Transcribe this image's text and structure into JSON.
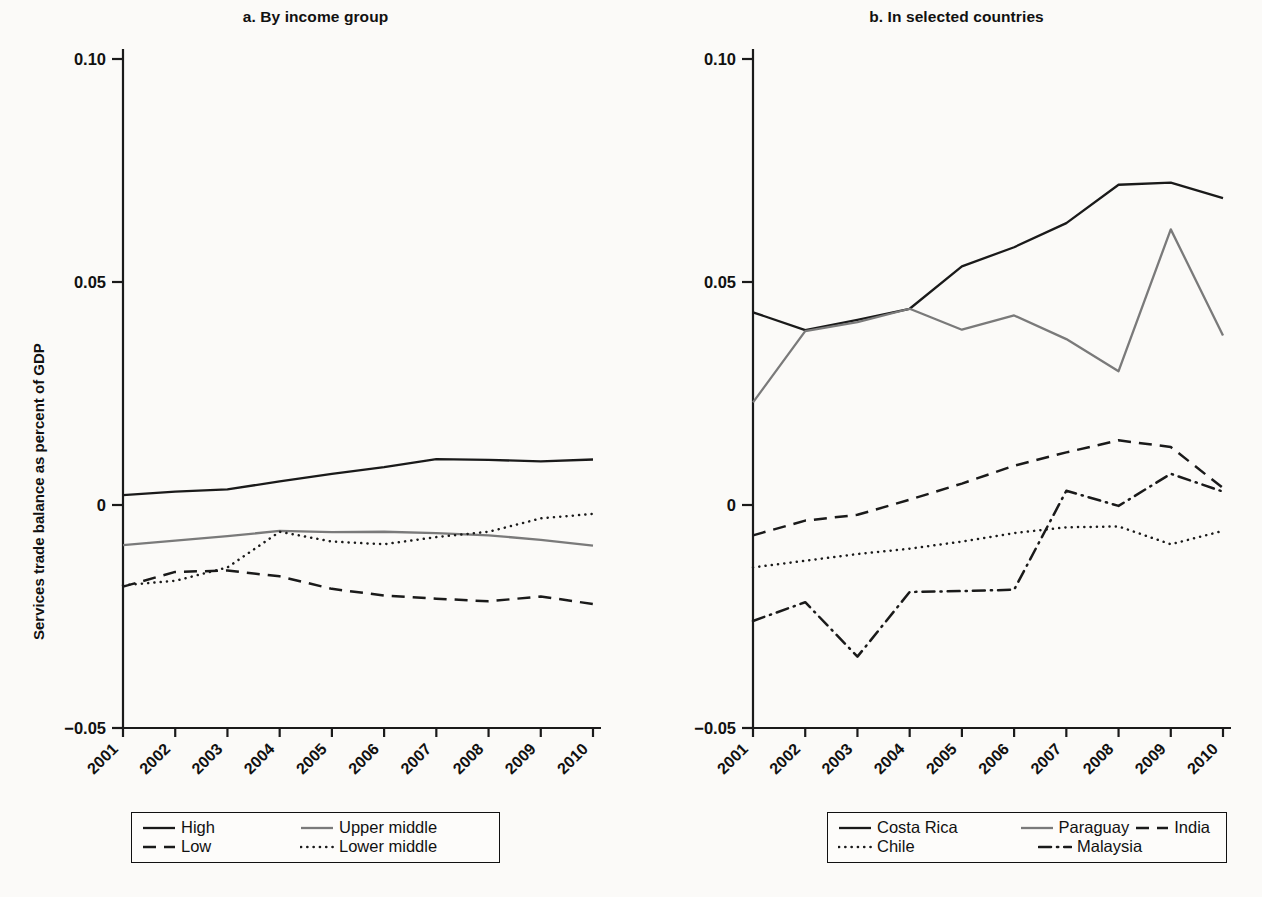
{
  "figure": {
    "ylabel": "Services trade balance as percent of GDP",
    "ytick_labels": [
      "0.10",
      "0.05",
      "0",
      "−0.05"
    ],
    "ytick_values": [
      0.1,
      0.05,
      0,
      -0.05
    ],
    "xtick_labels": [
      "2001",
      "2002",
      "2003",
      "2004",
      "2005",
      "2006",
      "2007",
      "2008",
      "2009",
      "2010"
    ]
  },
  "panel_a": {
    "title": "a. By income group",
    "legend": [
      {
        "label": "High",
        "style": "solid",
        "color": "#1a1a1a",
        "icon": "line-solid-black-icon"
      },
      {
        "label": "Upper middle",
        "style": "solid",
        "color": "#7a7a7a",
        "icon": "line-solid-gray-icon"
      },
      {
        "label": "Low",
        "style": "dashed",
        "color": "#1a1a1a",
        "icon": "line-dashed-icon"
      },
      {
        "label": "Lower middle",
        "style": "dotted",
        "color": "#1a1a1a",
        "icon": "line-dotted-icon"
      }
    ]
  },
  "panel_b": {
    "title": "b. In selected countries",
    "legend": [
      {
        "label": "Costa Rica",
        "style": "solid",
        "color": "#1a1a1a",
        "icon": "line-solid-black-icon"
      },
      {
        "label": "Paraguay",
        "style": "solid",
        "color": "#7a7a7a",
        "icon": "line-solid-gray-icon"
      },
      {
        "label": "India",
        "style": "dashed",
        "color": "#1a1a1a",
        "icon": "line-dashed-icon"
      },
      {
        "label": "Chile",
        "style": "dotted",
        "color": "#1a1a1a",
        "icon": "line-dotted-icon"
      },
      {
        "label": "Malaysia",
        "style": "dashdot",
        "color": "#1a1a1a",
        "icon": "line-dashdot-icon"
      }
    ]
  },
  "chart_data": [
    {
      "id": "panel_a",
      "type": "line",
      "title": "a. By income group",
      "xlabel": "",
      "ylabel": "Services trade balance as percent of GDP",
      "x": [
        2001,
        2002,
        2003,
        2004,
        2005,
        2006,
        2007,
        2008,
        2009,
        2010
      ],
      "ylim": [
        -0.05,
        0.1
      ],
      "yticks": [
        -0.05,
        0,
        0.05,
        0.1
      ],
      "grid": false,
      "legend_position": "bottom",
      "series": [
        {
          "name": "High",
          "style": "solid",
          "color": "#1a1a1a",
          "values": [
            0.0022,
            0.003,
            0.0035,
            0.0053,
            0.007,
            0.0085,
            0.0103,
            0.0101,
            0.0098,
            0.0102
          ]
        },
        {
          "name": "Upper middle",
          "style": "solid",
          "color": "#7a7a7a",
          "values": [
            -0.009,
            -0.008,
            -0.007,
            -0.0058,
            -0.0061,
            -0.006,
            -0.0063,
            -0.0068,
            -0.0078,
            -0.0091
          ]
        },
        {
          "name": "Low",
          "style": "dashed",
          "color": "#1a1a1a",
          "values": [
            -0.0183,
            -0.015,
            -0.0147,
            -0.016,
            -0.0188,
            -0.0203,
            -0.021,
            -0.0216,
            -0.0205,
            -0.0222
          ]
        },
        {
          "name": "Lower middle",
          "style": "dotted",
          "color": "#1a1a1a",
          "values": [
            -0.018,
            -0.017,
            -0.014,
            -0.006,
            -0.0082,
            -0.0088,
            -0.0072,
            -0.006,
            -0.003,
            -0.002
          ]
        }
      ]
    },
    {
      "id": "panel_b",
      "type": "line",
      "title": "b. In selected countries",
      "xlabel": "",
      "ylabel": "Services trade balance as percent of GDP",
      "x": [
        2001,
        2002,
        2003,
        2004,
        2005,
        2006,
        2007,
        2008,
        2009,
        2010
      ],
      "ylim": [
        -0.05,
        0.1
      ],
      "yticks": [
        -0.05,
        0,
        0.05,
        0.1
      ],
      "grid": false,
      "legend_position": "bottom",
      "series": [
        {
          "name": "Costa Rica",
          "style": "solid",
          "color": "#1a1a1a",
          "values": [
            0.0432,
            0.0392,
            0.0415,
            0.044,
            0.0535,
            0.0578,
            0.0632,
            0.0718,
            0.0723,
            0.0688
          ]
        },
        {
          "name": "Paraguay",
          "style": "solid",
          "color": "#7a7a7a",
          "values": [
            0.023,
            0.039,
            0.041,
            0.044,
            0.0393,
            0.0425,
            0.0372,
            0.03,
            0.0618,
            0.038
          ]
        },
        {
          "name": "India",
          "style": "dashed",
          "color": "#1a1a1a",
          "values": [
            -0.0068,
            -0.0035,
            -0.0022,
            0.0012,
            0.0048,
            0.0088,
            0.0118,
            0.0145,
            0.013,
            0.0038
          ]
        },
        {
          "name": "Chile",
          "style": "dotted",
          "color": "#1a1a1a",
          "values": [
            -0.014,
            -0.0125,
            -0.011,
            -0.0098,
            -0.0082,
            -0.0063,
            -0.005,
            -0.0048,
            -0.0088,
            -0.0058
          ]
        },
        {
          "name": "Malaysia",
          "style": "dashdot",
          "color": "#1a1a1a",
          "values": [
            -0.026,
            -0.0218,
            -0.034,
            -0.0195,
            -0.0193,
            -0.019,
            0.0032,
            -0.0002,
            0.007,
            0.003
          ]
        }
      ]
    }
  ]
}
